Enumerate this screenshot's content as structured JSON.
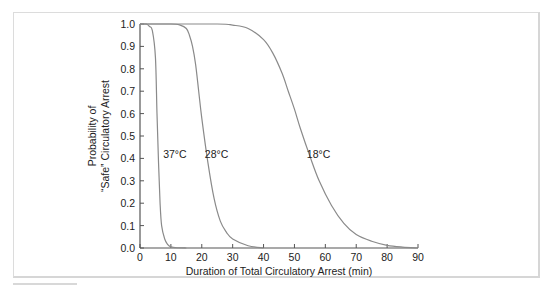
{
  "chart_data": {
    "type": "line",
    "title": "",
    "xlabel": "Duration of Total Circulatory Arrest (min)",
    "ylabel_lines": [
      "Probability of",
      "“Safe” Circulatory Arrest"
    ],
    "xlim": [
      0,
      90
    ],
    "ylim": [
      0.0,
      1.0
    ],
    "x_ticks": [
      "0",
      "10",
      "20",
      "30",
      "40",
      "50",
      "60",
      "70",
      "80",
      "90"
    ],
    "y_ticks": [
      "0.0",
      "0.1",
      "0.2",
      "0.3",
      "0.4",
      "0.5",
      "0.6",
      "0.7",
      "0.8",
      "0.9",
      "1.0"
    ],
    "grid": false,
    "legend": "inline labels",
    "series": [
      {
        "name": "37°C",
        "x": [
          0,
          2,
          3,
          4,
          5,
          5.5,
          6,
          6.5,
          7,
          8,
          9,
          10,
          12,
          15
        ],
        "y": [
          1.0,
          1.0,
          0.99,
          0.97,
          0.85,
          0.6,
          0.38,
          0.2,
          0.1,
          0.04,
          0.015,
          0.005,
          0.001,
          0.0
        ]
      },
      {
        "name": "28°C",
        "x": [
          0,
          10,
          13,
          15,
          16,
          17,
          18,
          19,
          20,
          22,
          24,
          26,
          28,
          30,
          35,
          40
        ],
        "y": [
          1.0,
          1.0,
          0.995,
          0.98,
          0.95,
          0.9,
          0.82,
          0.7,
          0.58,
          0.38,
          0.22,
          0.12,
          0.07,
          0.04,
          0.01,
          0.0
        ]
      },
      {
        "name": "18°C",
        "x": [
          0,
          25,
          30,
          35,
          40,
          43,
          46,
          48,
          50,
          52,
          55,
          58,
          62,
          66,
          70,
          75,
          80,
          85,
          90
        ],
        "y": [
          1.0,
          1.0,
          0.995,
          0.98,
          0.93,
          0.87,
          0.78,
          0.7,
          0.62,
          0.53,
          0.41,
          0.3,
          0.19,
          0.11,
          0.06,
          0.03,
          0.012,
          0.004,
          0.0
        ]
      }
    ],
    "annotations": [
      {
        "text": "37°C",
        "x": 7.5,
        "y": 0.4
      },
      {
        "text": "28°C",
        "x": 21,
        "y": 0.4
      },
      {
        "text": "18°C",
        "x": 54,
        "y": 0.4
      }
    ],
    "colors": {
      "curve": "#8a8a8a",
      "axis": "#555555",
      "frame": "#dcdcdc"
    }
  }
}
